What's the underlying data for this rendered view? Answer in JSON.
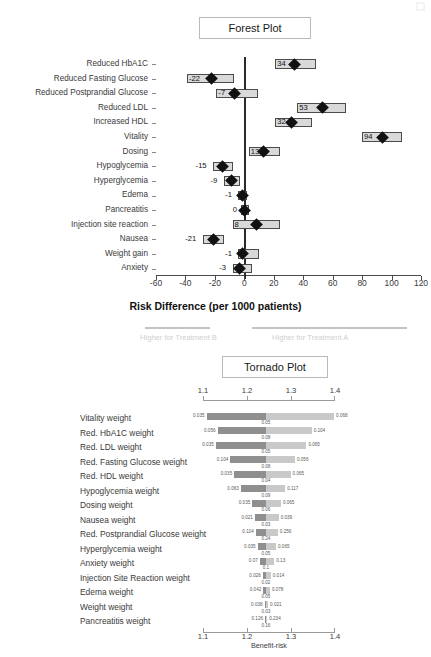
{
  "forest": {
    "title": "Forest Plot",
    "x_axis_title": "Risk Difference (per 1000 patients)",
    "legend_left": "Higher for Treatment B",
    "legend_right": "Higher for Treatment A"
  },
  "tornado": {
    "title": "Tornado Plot",
    "x_axis_title": "Benefit-risk"
  },
  "chart_data": [
    {
      "type": "bar",
      "id": "forest-plot",
      "title": "Forest Plot",
      "xlabel": "Risk Difference (per 1000 patients)",
      "ylabel": "",
      "xlim": [
        -60,
        120
      ],
      "xticks": [
        -60,
        -40,
        -20,
        0,
        20,
        40,
        60,
        80,
        100,
        120
      ],
      "grid": false,
      "reference_line": 0,
      "annotations": [
        "Higher for Treatment B",
        "Higher for Treatment A"
      ],
      "categories": [
        "Reduced HbA1C",
        "Reduced Fasting Glucose",
        "Reduced Postprandial Glucose",
        "Reduced LDL",
        "Increased HDL",
        "Vitality",
        "Dosing",
        "Hypoglycemia",
        "Hyperglycemia",
        "Edema",
        "Pancreatitis",
        "Injection site reaction",
        "Nausea",
        "Weight gain",
        "Anxiety"
      ],
      "points": [
        {
          "label": "Reduced HbA1C",
          "value": 34,
          "low": 21,
          "high": 49,
          "label_text": "34"
        },
        {
          "label": "Reduced Fasting Glucose",
          "value": -22,
          "low": -39,
          "high": -7,
          "label_text": "-22"
        },
        {
          "label": "Reduced Postprandial Glucose",
          "value": -7,
          "low": -19,
          "high": 9,
          "label_text": "-7"
        },
        {
          "label": "Reduced LDL",
          "value": 53,
          "low": 36,
          "high": 69,
          "label_text": "53"
        },
        {
          "label": "Increased HDL",
          "value": 32,
          "low": 21,
          "high": 46,
          "label_text": "32"
        },
        {
          "label": "Vitality",
          "value": 94,
          "low": 80,
          "high": 107,
          "label_text": "94"
        },
        {
          "label": "Dosing",
          "value": 13,
          "low": 3,
          "high": 24,
          "label_text": "13"
        },
        {
          "label": "Hypoglycemia",
          "value": -15,
          "low": -21,
          "high": -8,
          "label_text": "-15"
        },
        {
          "label": "Hyperglycemia",
          "value": -9,
          "low": -14,
          "high": -3,
          "label_text": "-9"
        },
        {
          "label": "Edema",
          "value": -1,
          "low": -4,
          "high": 2,
          "label_text": "-1"
        },
        {
          "label": "Pancreatitis",
          "value": 0,
          "low": -2,
          "high": 3,
          "label_text": "0"
        },
        {
          "label": "Injection site reaction",
          "value": 8,
          "low": -8,
          "high": 24,
          "label_text": "8"
        },
        {
          "label": "Nausea",
          "value": -21,
          "low": -28,
          "high": -14,
          "label_text": "-21"
        },
        {
          "label": "Weight gain",
          "value": -1,
          "low": -4,
          "high": 10,
          "label_text": "-1"
        },
        {
          "label": "Anxiety",
          "value": -3,
          "low": -8,
          "high": 5,
          "label_text": "-3"
        }
      ]
    },
    {
      "type": "bar",
      "id": "tornado-plot",
      "title": "Tornado Plot",
      "xlabel": "Benefit-risk",
      "xlim": [
        1.1,
        1.4
      ],
      "xticks": [
        1.1,
        1.2,
        1.3,
        1.4
      ],
      "xtick_labels": [
        "1.1",
        "1.2",
        "1.3",
        "1.4"
      ],
      "grid": false,
      "base_value": 1.243,
      "categories": [
        "Vitality weight",
        "Red. HbA1C weight",
        "Red. LDL weight",
        "Red. Fasting Glucose weight",
        "Red. HDL weight",
        "Hypoglycemia weight",
        "Dosing weight",
        "Nausea weight",
        "Red. Postprandial Glucose weight",
        "Hyperglycemia weight",
        "Anxiety weight",
        "Injection Site Reaction weight",
        "Edema weight",
        "Weight weight",
        "Pancreatitis weight"
      ],
      "bars": [
        {
          "label": "Vitality weight",
          "left_label": "0.035",
          "right_label": "0.068",
          "base_label": "0.05",
          "low": 1.108,
          "high": 1.398
        },
        {
          "label": "Red. HbA1C weight",
          "left_label": "0.056",
          "right_label": "0.104",
          "base_label": "0.08",
          "low": 1.133,
          "high": 1.347
        },
        {
          "label": "Red. LDL weight",
          "left_label": "0.035",
          "right_label": "0.065",
          "base_label": "0.05",
          "low": 1.129,
          "high": 1.335
        },
        {
          "label": "Red. Fasting Glucose weight",
          "left_label": "0.104",
          "right_label": "0.056",
          "base_label": "0.08",
          "low": 1.162,
          "high": 1.309
        },
        {
          "label": "Red. HDL weight",
          "left_label": "0.035",
          "right_label": "0.065",
          "base_label": "0.04",
          "low": 1.171,
          "high": 1.299
        },
        {
          "label": "Hypoglycemia weight",
          "left_label": "0.063",
          "right_label": "0.117",
          "base_label": "0.09",
          "low": 1.186,
          "high": 1.287
        },
        {
          "label": "Dosing weight",
          "left_label": "0.035",
          "right_label": "0.065",
          "base_label": "0.06",
          "low": 1.212,
          "high": 1.277
        },
        {
          "label": "Nausea weight",
          "left_label": "0.021",
          "right_label": "0.039",
          "base_label": "0.03",
          "low": 1.218,
          "high": 1.272
        },
        {
          "label": "Red. Postprandial Glucose weight",
          "left_label": "0.104",
          "right_label": "0.256",
          "base_label": "0.24",
          "low": 1.22,
          "high": 1.27
        },
        {
          "label": "Hyperglycemia weight",
          "left_label": "0.035",
          "right_label": "0.065",
          "base_label": "0.05",
          "low": 1.224,
          "high": 1.266
        },
        {
          "label": "Anxiety weight",
          "left_label": "0.07",
          "right_label": "0.13",
          "base_label": "0.1",
          "low": 1.229,
          "high": 1.262
        },
        {
          "label": "Injection Site Reaction weight",
          "left_label": "0.026",
          "right_label": "0.014",
          "base_label": "0.02",
          "low": 1.236,
          "high": 1.254
        },
        {
          "label": "Edema weight",
          "left_label": "0.042",
          "right_label": "0.078",
          "base_label": "0.05",
          "low": 1.237,
          "high": 1.252
        },
        {
          "label": "Weight weight",
          "left_label": "0.038",
          "right_label": "0.021",
          "base_label": "0.03",
          "low": 1.24,
          "high": 1.248
        },
        {
          "label": "Pancreatitis weight",
          "left_label": "0.126",
          "right_label": "0.234",
          "base_label": "0.16",
          "low": 1.241,
          "high": 1.246
        }
      ]
    }
  ]
}
